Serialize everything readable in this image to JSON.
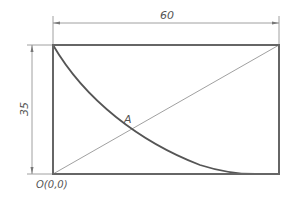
{
  "diagram": {
    "type": "engineering-drawing",
    "rectangle": {
      "x": 53,
      "y": 45,
      "width": 226,
      "height": 129
    },
    "dimensions": {
      "width_label": "60",
      "height_label": "35"
    },
    "labels": {
      "point_a": "A",
      "origin": "O(0,0)"
    },
    "colors": {
      "outline": "#555555",
      "thin_line": "#777777",
      "label": "#555555"
    }
  }
}
